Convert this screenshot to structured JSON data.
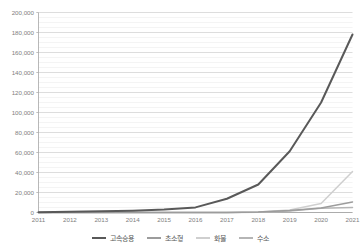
{
  "chart_data": {
    "type": "line",
    "title": "",
    "xlabel": "",
    "ylabel": "",
    "categories": [
      "2011",
      "2012",
      "2013",
      "2014",
      "2015",
      "2016",
      "2017",
      "2018",
      "2019",
      "2020",
      "2021"
    ],
    "ylim": [
      0,
      200000
    ],
    "ytick_values": [
      0,
      20000,
      40000,
      60000,
      80000,
      100000,
      120000,
      140000,
      160000,
      180000,
      200000
    ],
    "ytick_labels": [
      "0",
      "20,000",
      "40,000",
      "60,000",
      "80,000",
      "100,000",
      "120,000",
      "140,000",
      "160,000",
      "180,000",
      "200,000"
    ],
    "grid": true,
    "minor_grid": true,
    "legend_position": "bottom",
    "series": [
      {
        "name": "고속승용",
        "color": "#595959",
        "values": [
          338,
          753,
          1183,
          1825,
          2907,
          5099,
          13724,
          28009,
          61256,
          110000,
          178000
        ]
      },
      {
        "name": "초소형",
        "color": "#9c9c9c",
        "values": [
          0,
          0,
          0,
          0,
          0,
          0,
          90,
          480,
          1900,
          4500,
          10500
        ]
      },
      {
        "name": "화물",
        "color": "#cfcfcf",
        "values": [
          0,
          0,
          0,
          0,
          0,
          0,
          120,
          600,
          2400,
          9000,
          41000
        ]
      },
      {
        "name": "수소",
        "color": "#b5b5b5",
        "values": [
          0,
          0,
          0,
          0,
          0,
          0,
          60,
          280,
          1400,
          4300,
          5100
        ]
      }
    ]
  },
  "legend": {
    "items": [
      {
        "label": "고속승용",
        "color": "#595959"
      },
      {
        "label": "초소형",
        "color": "#9c9c9c"
      },
      {
        "label": "화물",
        "color": "#cfcfcf"
      },
      {
        "label": "수소",
        "color": "#b5b5b5"
      }
    ]
  }
}
